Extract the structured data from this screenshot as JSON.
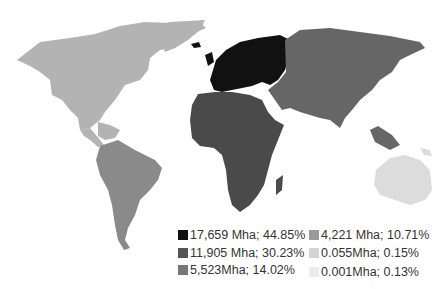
{
  "map": {
    "type": "choropleth",
    "regions": [
      {
        "name": "Europe",
        "color": "#111111",
        "value": "17,659 Mha",
        "share": "44.85%"
      },
      {
        "name": "Asia & Africa",
        "color": "#555555",
        "value": "11,905 Mha",
        "share": "30.23%"
      },
      {
        "name": "South America",
        "color": "#777777",
        "value": "5,523Mha",
        "share": "14.02%"
      },
      {
        "name": "North America",
        "color": "#9a9a9a",
        "value": "4,221 Mha",
        "share": "10.71%"
      },
      {
        "name": "Oceania",
        "color": "#d4d4d4",
        "value": "0.055Mha",
        "share": "0.15%"
      },
      {
        "name": "Other",
        "color": "#ececec",
        "value": "0.001Mha",
        "share": "0.13%"
      }
    ]
  },
  "legend": {
    "items": [
      {
        "label": "17,659 Mha; 44.85%",
        "color": "#111111"
      },
      {
        "label": "11,905 Mha; 30.23%",
        "color": "#555555"
      },
      {
        "label": "5,523Mha; 14.02%",
        "color": "#777777"
      },
      {
        "label": "4,221 Mha; 10.71%",
        "color": "#9a9a9a"
      },
      {
        "label": "0.055Mha; 0.15%",
        "color": "#d4d4d4"
      },
      {
        "label": "0.001Mha; 0.13%",
        "color": "#ececec"
      }
    ]
  }
}
